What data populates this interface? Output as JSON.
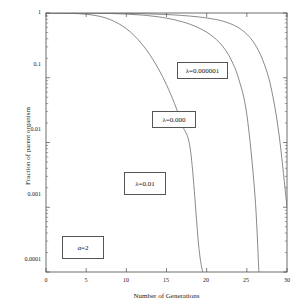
{
  "chart_data": {
    "type": "line",
    "title": "",
    "xlabel": "Number of Generations",
    "ylabel": "Fraction of parent organism",
    "xlim": [
      0,
      30
    ],
    "ylim": [
      0.0001,
      1
    ],
    "yscale": "log",
    "grid": false,
    "legend": "none",
    "xticks": [
      "0",
      "5",
      "10",
      "15",
      "20",
      "25",
      "30"
    ],
    "xtick_values": [
      0,
      5,
      10,
      15,
      20,
      25,
      30
    ],
    "yticks": [
      "1",
      "0.1",
      "0.01",
      "0.001",
      "0.0001"
    ],
    "ytick_values": [
      1,
      0.1,
      0.01,
      0.001,
      0.0001
    ],
    "series": [
      {
        "name": "lambda=0.01",
        "x": [
          0,
          1,
          2,
          3,
          4,
          5,
          6,
          7,
          8,
          9,
          10,
          11,
          12,
          13,
          14,
          15,
          16,
          17,
          18,
          19,
          19.5
        ],
        "values": [
          1.0,
          0.999,
          0.996,
          0.99,
          0.978,
          0.957,
          0.922,
          0.868,
          0.79,
          0.69,
          0.572,
          0.446,
          0.325,
          0.22,
          0.137,
          0.078,
          0.04,
          0.0182,
          0.0073,
          0.00026,
          0.0001
        ]
      },
      {
        "name": "lambda=0.000",
        "x": [
          0,
          2,
          4,
          6,
          8,
          10,
          12,
          14,
          15,
          16,
          17,
          18,
          19,
          20,
          21,
          22,
          23,
          24,
          25,
          26,
          26.5
        ],
        "values": [
          1.0,
          0.9995,
          0.998,
          0.993,
          0.983,
          0.963,
          0.928,
          0.872,
          0.833,
          0.786,
          0.73,
          0.665,
          0.59,
          0.505,
          0.41,
          0.305,
          0.195,
          0.095,
          0.027,
          0.0016,
          0.0001
        ]
      },
      {
        "name": "lambda=0.000001",
        "x": [
          0,
          3,
          6,
          9,
          12,
          15,
          17,
          19,
          21,
          22,
          23,
          24,
          25,
          26,
          27,
          28,
          29,
          30
        ],
        "values": [
          1.0,
          0.9993,
          0.997,
          0.99,
          0.975,
          0.946,
          0.915,
          0.87,
          0.8,
          0.75,
          0.68,
          0.59,
          0.47,
          0.33,
          0.185,
          0.072,
          0.0135,
          0.001
        ]
      }
    ],
    "annotations": [
      {
        "text": "λ=0.000001",
        "x": 22.0,
        "y": 0.125
      },
      {
        "text": "λ=0.000",
        "x": 16.8,
        "y": 0.0205
      },
      {
        "text": "λ=0.01",
        "x": 12.4,
        "y": 0.0028
      },
      {
        "text": "α=2",
        "x": 5.2,
        "y": 0.00026
      }
    ]
  },
  "annotation_boxes": [
    {
      "label": "λ=0.000001",
      "left": 177,
      "top": 62,
      "width": 51,
      "height": 17
    },
    {
      "label": "λ=0.000",
      "left": 152,
      "top": 111,
      "width": 44,
      "height": 17
    },
    {
      "label": "λ=0.01",
      "left": 124,
      "top": 172,
      "width": 42,
      "height": 23
    },
    {
      "label": "α=2",
      "left": 62,
      "top": 236,
      "width": 42,
      "height": 23
    }
  ],
  "ytick_positions": [
    {
      "label": "1",
      "top": 9,
      "left": 14,
      "width": 27
    },
    {
      "label": "0.1",
      "top": 61,
      "left": 14,
      "width": 27
    },
    {
      "label": "0.01",
      "top": 126,
      "left": 14,
      "width": 27
    },
    {
      "label": "0.001",
      "top": 191,
      "left": 14,
      "width": 27
    },
    {
      "label": "0.0001",
      "top": 256,
      "left": 10,
      "width": 31
    }
  ],
  "xtick_positions": [
    {
      "label": "0",
      "left": 36,
      "top": 277,
      "width": 20
    },
    {
      "label": "5",
      "left": 76,
      "top": 277,
      "width": 20
    },
    {
      "label": "10",
      "left": 116,
      "top": 277,
      "width": 20
    },
    {
      "label": "15",
      "left": 156,
      "top": 277,
      "width": 20
    },
    {
      "label": "20",
      "left": 196,
      "top": 277,
      "width": 20
    },
    {
      "label": "25",
      "left": 236,
      "top": 277,
      "width": 20
    },
    {
      "label": "30",
      "left": 277,
      "top": 277,
      "width": 20
    }
  ],
  "style": {
    "axis_color": "#4a4a4a",
    "curve_color": "#6b6b6b",
    "text_color": "#1a1a1a",
    "background": "#ffffff"
  }
}
